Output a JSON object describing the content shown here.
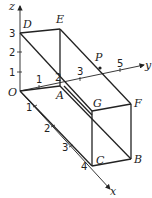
{
  "diagram": {
    "type": "3d-cuboid-coordinate-axes",
    "axes": {
      "x": {
        "label": "x",
        "ticks": [
          "1",
          "2",
          "3",
          "4"
        ]
      },
      "y": {
        "label": "y",
        "ticks": [
          "1",
          "3",
          "5"
        ]
      },
      "z": {
        "label": "z",
        "ticks": [
          "1",
          "2",
          "3"
        ]
      },
      "origin_label": "O"
    },
    "vertices": {
      "O": "O",
      "A": "A",
      "B": "B",
      "C": "C",
      "D": "D",
      "E": "E",
      "F": "F",
      "G": "G",
      "P": "P"
    },
    "extra_labels": {
      "A_top_tick": "2"
    },
    "edges": [
      "OA",
      "OD",
      "DE",
      "AE",
      "AB",
      "BF",
      "EF",
      "FG",
      "GC",
      "CB",
      "DG",
      "OC",
      "GE"
    ]
  }
}
